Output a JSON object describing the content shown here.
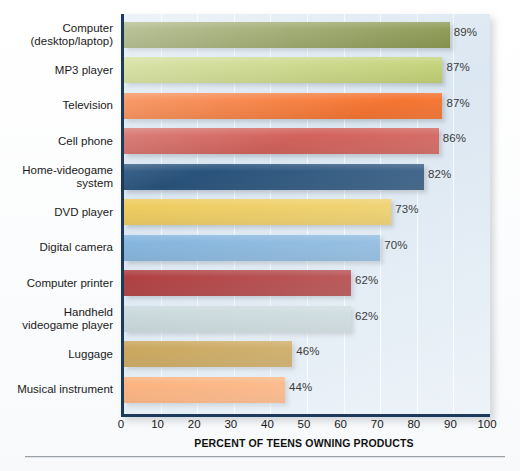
{
  "chart_data": {
    "type": "bar",
    "orientation": "horizontal",
    "title": "",
    "xlabel": "PERCENT OF TEENS OWNING PRODUCTS",
    "ylabel": "",
    "xlim": [
      0,
      100
    ],
    "xticks": [
      0,
      10,
      20,
      30,
      40,
      50,
      60,
      70,
      80,
      90,
      100
    ],
    "grid": true,
    "grid_axis": "x",
    "legend": "none",
    "value_suffix": "%",
    "categories": [
      "Computer\n(desktop/laptop)",
      "MP3 player",
      "Television",
      "Cell phone",
      "Home-videogame\nsystem",
      "DVD player",
      "Digital camera",
      "Computer printer",
      "Handheld\nvideogame player",
      "Luggage",
      "Musical instrument"
    ],
    "values": [
      89,
      87,
      87,
      86,
      82,
      73,
      70,
      62,
      62,
      46,
      44
    ],
    "value_labels": [
      "89%",
      "87%",
      "87%",
      "86%",
      "82%",
      "73%",
      "70%",
      "62%",
      "62%",
      "46%",
      "44%"
    ],
    "colors": [
      "#6f8029",
      "#bccc66",
      "#f4651a",
      "#cd5049",
      "#11406e",
      "#ecc64b",
      "#6fa8d8",
      "#9c0f11",
      "#b9cdd2",
      "#b5831a",
      "#fb8b3c"
    ]
  },
  "style": {
    "plot_background": "#d7e4f0",
    "axis_color": "#1d3a5c",
    "gridline_color": "#ffffff",
    "label_color": "#1a1a1a",
    "value_color": "#3b3b3b",
    "page_background": "#ffffff"
  }
}
